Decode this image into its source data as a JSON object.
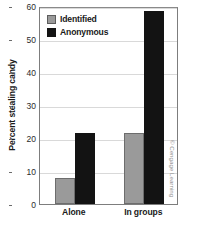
{
  "chart_data": {
    "type": "bar",
    "title": "",
    "xlabel": "",
    "ylabel": "Percent stealing candy",
    "categories": [
      "Alone",
      "In groups"
    ],
    "series": [
      {
        "name": "Identified",
        "color": "#9a9a9a",
        "values": [
          8,
          21.5
        ]
      },
      {
        "name": "Anonymous",
        "color": "#131313",
        "values": [
          21.5,
          58.5
        ]
      }
    ],
    "ylim": [
      0,
      60
    ],
    "yticks": [
      0,
      10,
      20,
      30,
      40,
      50,
      60
    ],
    "ytick_labels": [
      "0",
      "10",
      "20",
      "30",
      "40",
      "50",
      "60"
    ],
    "grid": "horizontal",
    "legend_position": "top-left-inside"
  },
  "legend": {
    "items": [
      {
        "label": "Identified",
        "swatch": "gray-square-swatch"
      },
      {
        "label": "Anonymous",
        "swatch": "black-square-swatch"
      }
    ]
  },
  "credit": {
    "text": "© Cengage Learning"
  }
}
